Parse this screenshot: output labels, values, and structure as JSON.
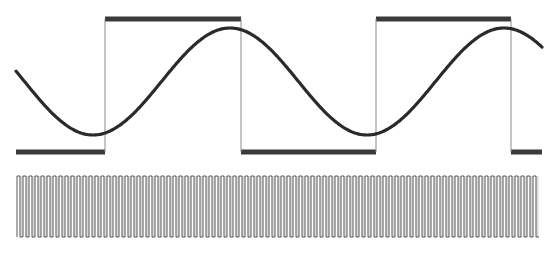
{
  "diagram": {
    "colors": {
      "background": "#ffffff",
      "sine": "#2a2a2a",
      "square_bar": "#3a3a3a",
      "square_edge": "#8a8a8a",
      "pulse": "#555555",
      "pulse_fill": "#d8d8d8"
    },
    "square_wave": {
      "high_y": 19,
      "low_y": 152,
      "x_start": 16,
      "x_end": 542,
      "edges": [
        {
          "x": 105,
          "type": "rising"
        },
        {
          "x": 241,
          "type": "falling"
        },
        {
          "x": 376,
          "type": "rising"
        },
        {
          "x": 511,
          "type": "falling"
        }
      ],
      "initial_level": "low"
    },
    "sine_wave": {
      "x_start": 16,
      "x_end": 542,
      "center_y": 81.5,
      "amplitude": 53.5,
      "period_px": 274,
      "trough_x": 93,
      "stroke_width": 3.2
    },
    "pulse_train": {
      "x_start": 17,
      "x_end": 538,
      "top_y": 176,
      "bottom_y": 237,
      "period_px": 6,
      "count": 87
    }
  }
}
